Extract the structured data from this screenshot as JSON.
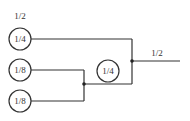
{
  "diagram": {
    "top_label": "1/2",
    "output_label": "1/2",
    "nodes": [
      {
        "id": "n1",
        "label": "1/4"
      },
      {
        "id": "n2",
        "label": "1/8"
      },
      {
        "id": "n3",
        "label": "1/8"
      },
      {
        "id": "n4",
        "label": "1/4"
      }
    ],
    "colors": {
      "stroke": "#333333",
      "background": "#ffffff"
    }
  }
}
